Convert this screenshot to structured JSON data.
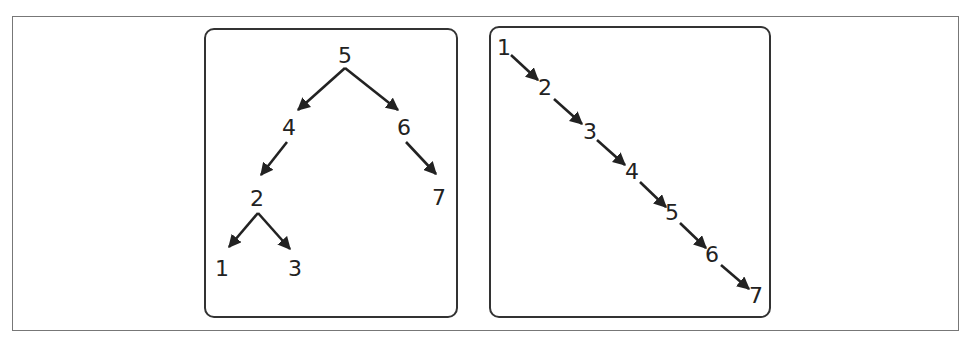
{
  "colors": {
    "stroke": "#222222",
    "panel_border": "#333333",
    "frame_border": "#777777",
    "background": "#ffffff"
  },
  "left_panel": {
    "title": "balanced-binary-search-tree",
    "nodes": [
      {
        "id": "5",
        "label": "5",
        "x": 345,
        "y": 55
      },
      {
        "id": "4",
        "label": "4",
        "x": 289,
        "y": 127
      },
      {
        "id": "6",
        "label": "6",
        "x": 404,
        "y": 127
      },
      {
        "id": "2",
        "label": "2",
        "x": 257,
        "y": 198
      },
      {
        "id": "7",
        "label": "7",
        "x": 439,
        "y": 197
      },
      {
        "id": "1",
        "label": "1",
        "x": 222,
        "y": 268
      },
      {
        "id": "3",
        "label": "3",
        "x": 295,
        "y": 268
      }
    ],
    "edges": [
      {
        "from": "5",
        "to": "4",
        "x1": 345,
        "y1": 68,
        "x2": 298,
        "y2": 110
      },
      {
        "from": "5",
        "to": "6",
        "x1": 345,
        "y1": 68,
        "x2": 398,
        "y2": 110
      },
      {
        "from": "4",
        "to": "2",
        "x1": 287,
        "y1": 142,
        "x2": 261,
        "y2": 175
      },
      {
        "from": "6",
        "to": "7",
        "x1": 406,
        "y1": 142,
        "x2": 436,
        "y2": 174
      },
      {
        "from": "2",
        "to": "1",
        "x1": 258,
        "y1": 213,
        "x2": 229,
        "y2": 247
      },
      {
        "from": "2",
        "to": "3",
        "x1": 258,
        "y1": 213,
        "x2": 290,
        "y2": 249
      }
    ]
  },
  "right_panel": {
    "title": "degenerate-linked-list-tree",
    "nodes": [
      {
        "id": "1",
        "label": "1",
        "x": 504,
        "y": 47
      },
      {
        "id": "2",
        "label": "2",
        "x": 545,
        "y": 87
      },
      {
        "id": "3",
        "label": "3",
        "x": 590,
        "y": 131
      },
      {
        "id": "4",
        "label": "4",
        "x": 632,
        "y": 171
      },
      {
        "id": "5",
        "label": "5",
        "x": 672,
        "y": 212
      },
      {
        "id": "6",
        "label": "6",
        "x": 712,
        "y": 254
      },
      {
        "id": "7",
        "label": "7",
        "x": 756,
        "y": 295
      }
    ],
    "edges": [
      {
        "from": "1",
        "to": "2",
        "x1": 511,
        "y1": 55,
        "x2": 538,
        "y2": 80
      },
      {
        "from": "2",
        "to": "3",
        "x1": 554,
        "y1": 99,
        "x2": 582,
        "y2": 124
      },
      {
        "from": "3",
        "to": "4",
        "x1": 597,
        "y1": 140,
        "x2": 625,
        "y2": 165
      },
      {
        "from": "4",
        "to": "5",
        "x1": 640,
        "y1": 182,
        "x2": 666,
        "y2": 207
      },
      {
        "from": "5",
        "to": "6",
        "x1": 680,
        "y1": 223,
        "x2": 706,
        "y2": 248
      },
      {
        "from": "6",
        "to": "7",
        "x1": 721,
        "y1": 265,
        "x2": 749,
        "y2": 289
      }
    ]
  }
}
